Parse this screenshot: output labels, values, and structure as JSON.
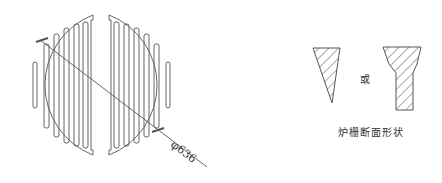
{
  "figure": {
    "grate_plan": {
      "name": "circular-grate-plan",
      "dimension_label": "φ636",
      "halves": 2,
      "slots_per_half": 6
    },
    "cross_sections": {
      "connector_word": "或",
      "caption": "炉栅断面形状",
      "shapes": [
        "triangular-section",
        "funnel-section"
      ]
    },
    "colors": {
      "line": "#555555",
      "background": "#ffffff"
    }
  }
}
